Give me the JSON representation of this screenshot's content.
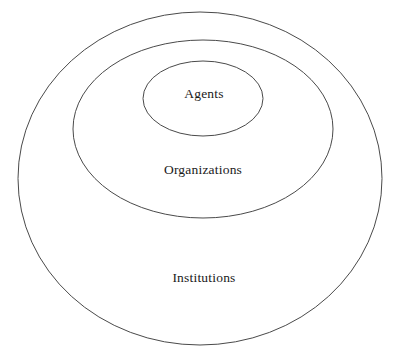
{
  "diagram": {
    "type": "nested-ellipses",
    "background_color": "#ffffff",
    "stroke_color": "#4a4a4a",
    "text_color": "#1a1a1a",
    "levels": [
      {
        "id": "institutions",
        "label": "Institutions",
        "depth": 0,
        "label_x": 204,
        "label_y": 279,
        "ellipse": {
          "cx": 200,
          "cy": 178.5,
          "rx": 182,
          "ry": 166.5
        }
      },
      {
        "id": "organizations",
        "label": "Organizations",
        "depth": 1,
        "label_x": 203,
        "label_y": 171,
        "ellipse": {
          "cx": 203,
          "cy": 129,
          "rx": 130,
          "ry": 89
        }
      },
      {
        "id": "agents",
        "label": "Agents",
        "depth": 2,
        "label_x": 204,
        "label_y": 95,
        "ellipse": {
          "cx": 203,
          "cy": 98.5,
          "rx": 60,
          "ry": 37.5
        }
      }
    ]
  }
}
